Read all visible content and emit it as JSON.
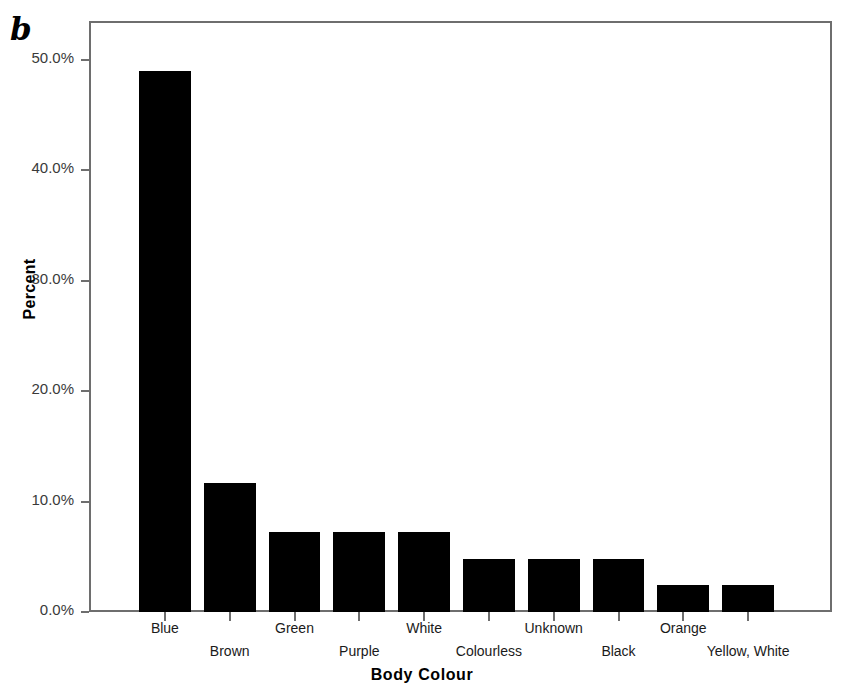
{
  "panel": {
    "label": "b"
  },
  "chart_data": {
    "type": "bar",
    "title": "",
    "xlabel": "Body Colour",
    "ylabel": "Percent",
    "categories": [
      "Blue",
      "Brown",
      "Green",
      "Purple",
      "White",
      "Colourless",
      "Unknown",
      "Black",
      "Orange",
      "Yellow, White"
    ],
    "values": [
      49.0,
      11.7,
      7.2,
      7.2,
      7.2,
      4.8,
      4.8,
      4.8,
      2.4,
      2.4
    ],
    "value_unit": "%",
    "ylim": [
      0,
      53.5
    ],
    "yticks": [
      0,
      10,
      20,
      30,
      40,
      50
    ],
    "ytick_labels": [
      "0.0%",
      "10.0%",
      "20.0%",
      "30.0%",
      "40.0%",
      "50.0%"
    ],
    "grid": false,
    "legend": false,
    "bar_color": "#000000",
    "axis_color": "#6e6e6e"
  }
}
